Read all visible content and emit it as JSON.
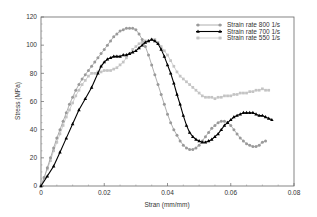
{
  "chart_data": {
    "type": "line",
    "title": "",
    "xlabel": "Stran (mm/mm)",
    "ylabel": "Stress (MPa)",
    "xlim": [
      0,
      0.08
    ],
    "ylim": [
      0,
      120
    ],
    "xticks": [
      0,
      0.02,
      0.04,
      0.06,
      0.08
    ],
    "xtick_labels": [
      "0",
      "0.02",
      "0.04",
      "0.06",
      "0.08"
    ],
    "yticks": [
      0,
      20,
      40,
      60,
      80,
      100,
      120
    ],
    "ytick_labels": [
      "0",
      "20",
      "40",
      "60",
      "80",
      "100",
      "120"
    ],
    "grid": false,
    "legend_position": "upper right",
    "series": [
      {
        "name": "Strain rate 800 1/s",
        "color": "#9a9a9a",
        "marker": "circle",
        "x": [
          0,
          0.001,
          0.002,
          0.003,
          0.004,
          0.005,
          0.006,
          0.007,
          0.008,
          0.009,
          0.01,
          0.011,
          0.012,
          0.013,
          0.014,
          0.015,
          0.016,
          0.017,
          0.018,
          0.019,
          0.02,
          0.021,
          0.022,
          0.023,
          0.024,
          0.025,
          0.026,
          0.027,
          0.028,
          0.029,
          0.03,
          0.031,
          0.032,
          0.033,
          0.034,
          0.035,
          0.036,
          0.037,
          0.038,
          0.039,
          0.04,
          0.041,
          0.042,
          0.043,
          0.044,
          0.045,
          0.046,
          0.047,
          0.048,
          0.049,
          0.05,
          0.051,
          0.052,
          0.053,
          0.054,
          0.055,
          0.056,
          0.057,
          0.058,
          0.059,
          0.06,
          0.061,
          0.062,
          0.063,
          0.064,
          0.065,
          0.066,
          0.067,
          0.068,
          0.069,
          0.07,
          0.071
        ],
        "values": [
          0,
          6,
          13,
          20,
          27,
          34,
          40,
          46,
          52,
          58,
          63,
          68,
          72,
          76,
          79,
          82,
          85,
          88,
          91,
          94,
          97,
          100,
          103,
          106,
          108,
          110,
          111,
          112,
          112,
          112,
          111,
          108,
          104,
          99,
          93,
          86,
          79,
          72,
          65,
          58,
          51,
          45,
          40,
          36,
          32,
          29,
          27,
          26,
          26,
          27,
          29,
          32,
          35,
          38,
          41,
          43,
          45,
          46,
          46,
          45,
          43,
          40,
          37,
          34,
          32,
          30,
          29,
          28,
          28,
          29,
          31,
          32
        ]
      },
      {
        "name": "Strain rate 700 1/s",
        "color": "#000000",
        "marker": "triangle",
        "x": [
          0,
          0.002,
          0.004,
          0.006,
          0.008,
          0.01,
          0.012,
          0.014,
          0.016,
          0.018,
          0.019,
          0.02,
          0.021,
          0.022,
          0.023,
          0.024,
          0.025,
          0.026,
          0.027,
          0.028,
          0.029,
          0.03,
          0.031,
          0.032,
          0.033,
          0.034,
          0.035,
          0.036,
          0.037,
          0.038,
          0.039,
          0.04,
          0.041,
          0.042,
          0.043,
          0.044,
          0.045,
          0.046,
          0.047,
          0.048,
          0.049,
          0.05,
          0.051,
          0.052,
          0.053,
          0.054,
          0.055,
          0.056,
          0.057,
          0.058,
          0.059,
          0.06,
          0.061,
          0.062,
          0.063,
          0.064,
          0.065,
          0.066,
          0.067,
          0.068,
          0.069,
          0.07,
          0.071,
          0.072,
          0.073
        ],
        "values": [
          0,
          7,
          14,
          24,
          34,
          44,
          54,
          62,
          70,
          80,
          85,
          88,
          90,
          91,
          92,
          92,
          92,
          93,
          93,
          94,
          95,
          96,
          98,
          100,
          102,
          103,
          104,
          103,
          101,
          97,
          92,
          86,
          80,
          73,
          65,
          58,
          50,
          43,
          38,
          35,
          33,
          32,
          31,
          31,
          32,
          33,
          35,
          37,
          40,
          43,
          45,
          47,
          49,
          50,
          51,
          52,
          52,
          52,
          52,
          51,
          50,
          50,
          49,
          48,
          47
        ]
      },
      {
        "name": "Strain rate 550 1/s",
        "color": "#c4c4c4",
        "marker": "square",
        "x": [
          0,
          0.001,
          0.002,
          0.003,
          0.004,
          0.005,
          0.006,
          0.007,
          0.008,
          0.009,
          0.01,
          0.011,
          0.012,
          0.013,
          0.014,
          0.015,
          0.016,
          0.017,
          0.018,
          0.019,
          0.02,
          0.021,
          0.022,
          0.023,
          0.024,
          0.025,
          0.026,
          0.027,
          0.028,
          0.029,
          0.03,
          0.031,
          0.032,
          0.033,
          0.034,
          0.035,
          0.036,
          0.037,
          0.038,
          0.039,
          0.04,
          0.041,
          0.042,
          0.043,
          0.044,
          0.045,
          0.046,
          0.047,
          0.048,
          0.049,
          0.05,
          0.051,
          0.052,
          0.053,
          0.054,
          0.055,
          0.056,
          0.057,
          0.058,
          0.059,
          0.06,
          0.061,
          0.062,
          0.063,
          0.064,
          0.065,
          0.066,
          0.067,
          0.068,
          0.069,
          0.07,
          0.071,
          0.072
        ],
        "values": [
          0,
          6,
          12,
          18,
          25,
          31,
          37,
          43,
          49,
          54,
          59,
          64,
          68,
          72,
          75,
          78,
          80,
          80,
          81,
          81,
          82,
          82,
          82,
          83,
          84,
          86,
          88,
          91,
          94,
          97,
          99,
          101,
          102,
          103,
          103,
          104,
          104,
          102,
          99,
          96,
          93,
          89,
          85,
          81,
          78,
          76,
          74,
          72,
          70,
          68,
          66,
          64,
          63,
          63,
          63,
          62,
          63,
          63,
          64,
          64,
          64,
          65,
          65,
          66,
          66,
          66,
          67,
          67,
          68,
          68,
          69,
          68,
          68
        ]
      }
    ]
  }
}
